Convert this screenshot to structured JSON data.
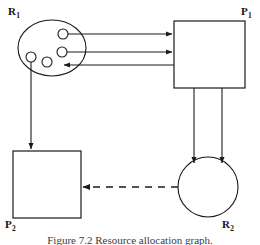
{
  "figure": {
    "type": "resource-allocation-graph",
    "caption": "Figure 7.2 Resource allocation graph.",
    "background_color": "#ffffff",
    "stroke_color": "#1a1a1a"
  },
  "nodes": {
    "r1": {
      "label": "R",
      "subscript": "1",
      "shape": "ellipse",
      "instances": 4,
      "label_position": {
        "x": 8,
        "y": 6
      }
    },
    "p1": {
      "label": "P",
      "subscript": "1",
      "shape": "rect",
      "label_position": {
        "x": 241,
        "y": 6
      }
    },
    "p2": {
      "label": "P",
      "subscript": "2",
      "shape": "rect",
      "label_position": {
        "x": 5,
        "y": 219
      }
    },
    "r2": {
      "label": "R",
      "subscript": "2",
      "shape": "circle",
      "instances": 1,
      "label_position": {
        "x": 222,
        "y": 219
      }
    }
  },
  "edges": [
    {
      "name": "r1-to-p1-assign-upper",
      "from": "R1",
      "to": "P1",
      "style": "solid",
      "direction": "right",
      "kind": "assignment"
    },
    {
      "name": "r1-to-p1-assign-lower",
      "from": "R1",
      "to": "P1",
      "style": "solid",
      "direction": "right",
      "kind": "assignment"
    },
    {
      "name": "p1-to-r1-request",
      "from": "P1",
      "to": "R1",
      "style": "solid",
      "direction": "left",
      "kind": "request"
    },
    {
      "name": "r1-to-p2-assign",
      "from": "R1",
      "to": "P2",
      "style": "solid",
      "direction": "down",
      "kind": "assignment"
    },
    {
      "name": "p1-to-r2-request-left",
      "from": "P1",
      "to": "R2",
      "style": "solid",
      "direction": "down",
      "kind": "request"
    },
    {
      "name": "p1-to-r2-request-right",
      "from": "P1",
      "to": "R2",
      "style": "solid",
      "direction": "down",
      "kind": "request"
    },
    {
      "name": "r2-to-p2-assign",
      "from": "R2",
      "to": "P2",
      "style": "dashed",
      "direction": "left",
      "kind": "assignment"
    }
  ]
}
